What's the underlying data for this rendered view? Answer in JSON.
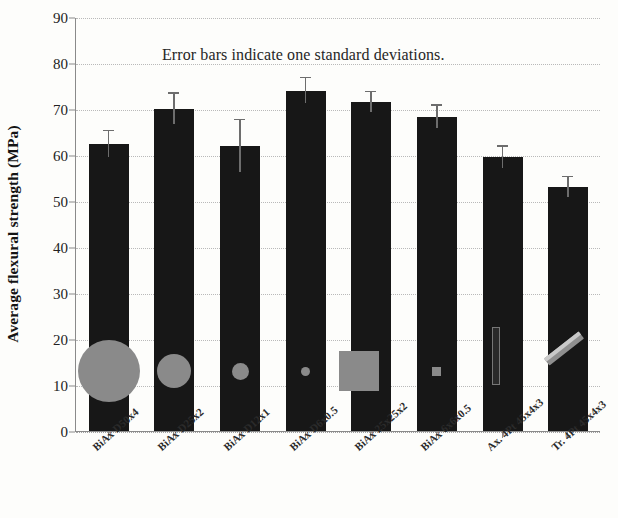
{
  "chart_data": {
    "type": "bar",
    "title": "",
    "xlabel": "",
    "ylabel": "Average flexural strength (MPa)",
    "ylim": [
      0,
      90
    ],
    "ytick_values": [
      0,
      10,
      20,
      30,
      40,
      50,
      60,
      70,
      80,
      90
    ],
    "ytick_labels": [
      "0",
      "10",
      "20",
      "30",
      "40",
      "50",
      "60",
      "70",
      "80",
      "90"
    ],
    "grid": true,
    "legend": "none",
    "annotations": [
      "Error bars indicate one standard deviations."
    ],
    "categories": [
      "BiAx D50x4",
      "BiAx D25x2",
      "BiAx D12x1",
      "BiAx D6x0.5",
      "BiAx 25x25x2",
      "BiAx 6x6x0.5",
      "Ax. 4Pt 45x4x3",
      "Tr. 4Pt 45x4x3"
    ],
    "values": [
      62.4,
      70.0,
      62.0,
      74.0,
      71.5,
      68.3,
      59.5,
      53.0
    ],
    "errors": [
      2.8,
      3.3,
      5.6,
      2.7,
      2.2,
      2.4,
      2.3,
      2.2
    ],
    "series": [
      {
        "name": "Average flexural strength",
        "values": [
          62.4,
          70.0,
          62.0,
          74.0,
          71.5,
          68.3,
          59.5,
          53.0
        ],
        "errors": [
          2.8,
          3.3,
          5.6,
          2.7,
          2.2,
          2.4,
          2.3,
          2.2
        ]
      }
    ],
    "bar_color": "#171717",
    "error_color": "#6d6d6d",
    "specimen_color": "#8a8a8a",
    "specimen_overlays": [
      {
        "shape": "circle",
        "size": 62,
        "label": "D50x4"
      },
      {
        "shape": "circle",
        "size": 34,
        "label": "D25x2"
      },
      {
        "shape": "circle",
        "size": 17,
        "label": "D12x1"
      },
      {
        "shape": "circle",
        "size": 9,
        "label": "D6x0.5"
      },
      {
        "shape": "square",
        "size": 40,
        "label": "25x25x2"
      },
      {
        "shape": "square",
        "size": 9,
        "label": "6x6x0.5"
      },
      {
        "shape": "vertical-bar",
        "size": 56,
        "label": "Ax. 4Pt 45x4x3"
      },
      {
        "shape": "angled-bar",
        "size": 44,
        "label": "Tr. 4Pt 45x4x3"
      }
    ]
  }
}
